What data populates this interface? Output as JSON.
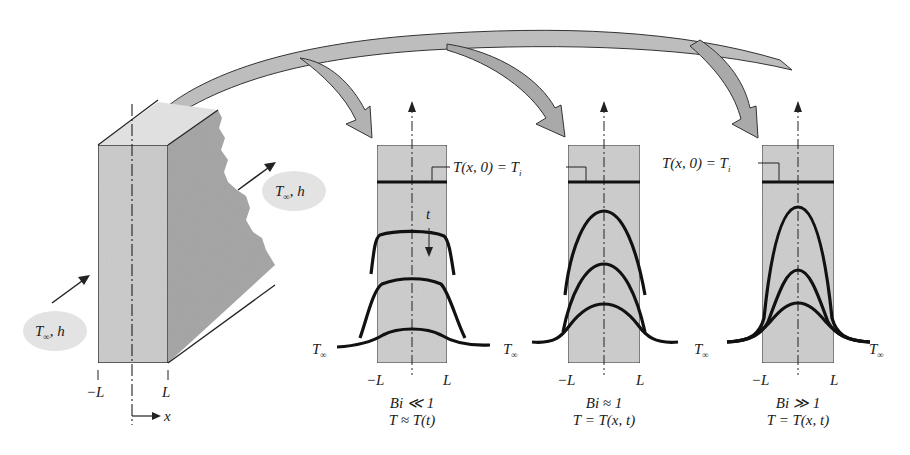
{
  "figure": {
    "colors": {
      "background": "#ffffff",
      "slab_fill": "#cfcfcf",
      "slab_side_fill": "#a9a9a9",
      "arrow_fill": "#b8b8b8",
      "curve": "#111111",
      "cloud": "#e2e2e2"
    }
  },
  "wall": {
    "ambient_right": {
      "T": "T",
      "sub": "∞",
      "rest": ", h"
    },
    "ambient_left": {
      "T": "T",
      "sub": "∞",
      "rest": ", h"
    },
    "left_bound": "−L",
    "right_bound": "L",
    "axis": "x"
  },
  "panels": [
    {
      "id": "bi-small",
      "initial_label": {
        "pre": "T(x, 0) = T",
        "sub": "i"
      },
      "time_label": "t",
      "ambient_left": {
        "T": "T",
        "sub": "∞"
      },
      "left_bound": "−L",
      "right_bound": "L",
      "biot": "Bi ≪ 1",
      "relation": "T ≈ T(t)"
    },
    {
      "id": "bi-one",
      "initial_label": {
        "pre": "T(x, 0) = T",
        "sub": "i"
      },
      "ambient_left": {
        "T": "T",
        "sub": "∞"
      },
      "left_bound": "−L",
      "right_bound": "L",
      "biot": "Bi ≈ 1",
      "relation": "T = T(x, t)"
    },
    {
      "id": "bi-large",
      "initial_label": {
        "pre": "T(x, 0) = T",
        "sub": "i"
      },
      "ambient_left": {
        "T": "T",
        "sub": "∞"
      },
      "ambient_right": {
        "T": "T",
        "sub": "∞"
      },
      "left_bound": "−L",
      "right_bound": "L",
      "biot": "Bi ≫ 1",
      "relation": "T = T(x, t)"
    }
  ]
}
